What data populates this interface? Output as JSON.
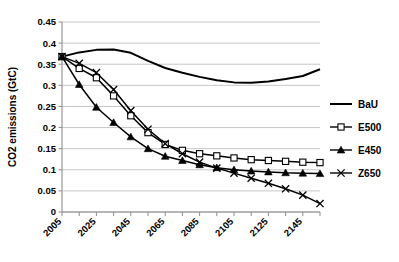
{
  "chart_data": {
    "type": "line",
    "title": "",
    "xlabel": "",
    "ylabel": "CO2 emissions (GtC)",
    "xlim": [
      2005,
      2155
    ],
    "ylim": [
      0,
      0.45
    ],
    "ytick_labels": [
      "0",
      "0.05",
      "0.1",
      "0.15",
      "0.2",
      "0.25",
      "0.3",
      "0.35",
      "0.4",
      "0.45"
    ],
    "ytick_values": [
      0,
      0.05,
      0.1,
      0.15,
      0.2,
      0.25,
      0.3,
      0.35,
      0.4,
      0.45
    ],
    "xtick_labels": [
      "2005",
      "2025",
      "2045",
      "2065",
      "2085",
      "2105",
      "2125",
      "2145"
    ],
    "xtick_values": [
      2005,
      2025,
      2045,
      2065,
      2085,
      2105,
      2125,
      2145
    ],
    "x_minor_step": 10,
    "grid": "horizontal",
    "legend_position": "right",
    "x": [
      2005,
      2015,
      2025,
      2035,
      2045,
      2055,
      2065,
      2075,
      2085,
      2095,
      2105,
      2115,
      2125,
      2135,
      2145,
      2155
    ],
    "series": [
      {
        "name": "BaU",
        "marker": "none",
        "color": "#000000",
        "values": [
          0.368,
          0.378,
          0.384,
          0.385,
          0.377,
          0.358,
          0.341,
          0.33,
          0.32,
          0.312,
          0.307,
          0.306,
          0.309,
          0.315,
          0.322,
          0.338
        ]
      },
      {
        "name": "E500",
        "marker": "open-square",
        "color": "#000000",
        "values": [
          0.368,
          0.34,
          0.318,
          0.275,
          0.228,
          0.188,
          0.16,
          0.146,
          0.138,
          0.133,
          0.128,
          0.124,
          0.122,
          0.12,
          0.118,
          0.117
        ]
      },
      {
        "name": "E450",
        "marker": "filled-triangle",
        "color": "#000000",
        "values": [
          0.368,
          0.302,
          0.248,
          0.212,
          0.178,
          0.15,
          0.132,
          0.122,
          0.112,
          0.105,
          0.1,
          0.097,
          0.095,
          0.093,
          0.092,
          0.091
        ]
      },
      {
        "name": "Z650",
        "marker": "cross",
        "color": "#000000",
        "values": [
          0.368,
          0.352,
          0.33,
          0.29,
          0.24,
          0.196,
          0.162,
          0.138,
          0.118,
          0.104,
          0.092,
          0.08,
          0.068,
          0.055,
          0.04,
          0.02
        ]
      }
    ]
  },
  "legend": {
    "items": [
      {
        "label": "BaU"
      },
      {
        "label": "E500"
      },
      {
        "label": "E450"
      },
      {
        "label": "Z650"
      }
    ]
  }
}
